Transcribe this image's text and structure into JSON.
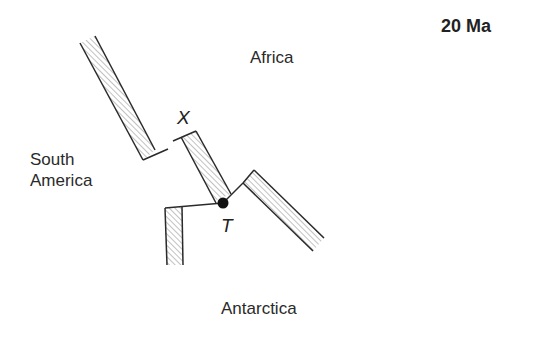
{
  "diagram": {
    "age_label": "20 Ma",
    "plates": {
      "africa": "Africa",
      "south_america_line1": "South",
      "south_america_line2": "America",
      "antarctica": "Antarctica"
    },
    "points": {
      "x": "X",
      "t": "T"
    },
    "colors": {
      "line": "#2a2a2a",
      "hatch": "#555555",
      "background": "#ffffff"
    }
  }
}
